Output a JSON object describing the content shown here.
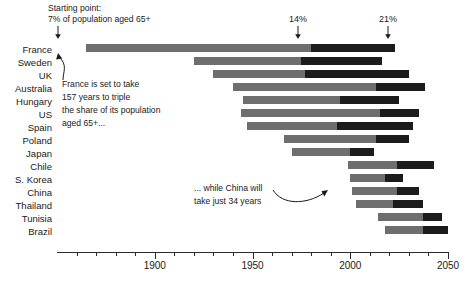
{
  "chart_data": {
    "type": "bar",
    "subtype": "horizontal-range-bar",
    "title": "",
    "xlabel": "",
    "ylabel": "",
    "xlim": [
      1850,
      2050
    ],
    "grid": false,
    "legend_position": "none",
    "x_ticks_major": [
      1900,
      1950,
      2000,
      2050
    ],
    "x_tick_labels": [
      "1900",
      "1950",
      "2000",
      "2050"
    ],
    "x_ticks_minor_step": 10,
    "x_tick_minor_start": 1860,
    "categories": [
      "France",
      "Sweden",
      "UK",
      "Australia",
      "Hungary",
      "US",
      "Spain",
      "Poland",
      "Japan",
      "Chile",
      "S. Korea",
      "China",
      "Thailand",
      "Tunisia",
      "Brazil"
    ],
    "series": [
      {
        "name": "7% to 14% of population aged 65+",
        "color": "#6e6e6e"
      },
      {
        "name": "14% to 21% of population aged 65+",
        "color": "#1c1c1c"
      }
    ],
    "bars": [
      {
        "country": "France",
        "start": 1865,
        "mid": 1980,
        "end": 2023
      },
      {
        "country": "Sweden",
        "start": 1920,
        "mid": 1975,
        "end": 2016
      },
      {
        "country": "UK",
        "start": 1930,
        "mid": 1977,
        "end": 2030
      },
      {
        "country": "Australia",
        "start": 1940,
        "mid": 2013,
        "end": 2038
      },
      {
        "country": "Hungary",
        "start": 1945,
        "mid": 1995,
        "end": 2025
      },
      {
        "country": "US",
        "start": 1944,
        "mid": 2015,
        "end": 2035
      },
      {
        "country": "Spain",
        "start": 1947,
        "mid": 1993,
        "end": 2032
      },
      {
        "country": "Poland",
        "start": 1966,
        "mid": 2013,
        "end": 2030
      },
      {
        "country": "Japan",
        "start": 1970,
        "mid": 2000,
        "end": 2012
      },
      {
        "country": "Chile",
        "start": 1999,
        "mid": 2024,
        "end": 2043
      },
      {
        "country": "S. Korea",
        "start": 2000,
        "mid": 2018,
        "end": 2027
      },
      {
        "country": "China",
        "start": 2001,
        "mid": 2024,
        "end": 2035
      },
      {
        "country": "Thailand",
        "start": 2003,
        "mid": 2022,
        "end": 2037
      },
      {
        "country": "Tunisia",
        "start": 2014,
        "mid": 2037,
        "end": 2047
      },
      {
        "country": "Brazil",
        "start": 2018,
        "mid": 2037,
        "end": 2050
      }
    ],
    "annotations": [
      {
        "id": "start-point",
        "text_line1": "Starting point:",
        "text_line2": "7% of population aged 65+",
        "points_to_year": 1865
      },
      {
        "id": "pct-14",
        "text": "14%",
        "points_to_year": 1980
      },
      {
        "id": "pct-21",
        "text": "21%",
        "points_to_year": 2023
      },
      {
        "id": "france-note",
        "line1": "France is set to take",
        "line2": "157 years to triple",
        "line3": "the share of its population",
        "line4": "aged 65+..."
      },
      {
        "id": "china-note",
        "line1": "... while China will",
        "line2": "take just 34 years"
      }
    ]
  },
  "axis": {
    "years": [
      "1900",
      "1950",
      "2000",
      "2050"
    ]
  },
  "categories": {
    "c0": "France",
    "c1": "Sweden",
    "c2": "UK",
    "c3": "Australia",
    "c4": "Hungary",
    "c5": "US",
    "c6": "Spain",
    "c7": "Poland",
    "c8": "Japan",
    "c9": "Chile",
    "c10": "S. Korea",
    "c11": "China",
    "c12": "Thailand",
    "c13": "Tunisia",
    "c14": "Brazil"
  },
  "annotations": {
    "start_line1": "Starting point:",
    "start_line2": "7% of population aged 65+",
    "pct14": "14%",
    "pct21": "21%",
    "france_l1": "France is set to take",
    "france_l2": "157 years to triple",
    "france_l3": "the share of its population",
    "france_l4": "aged 65+...",
    "china_l1": "... while China will",
    "china_l2": "take just 34 years"
  },
  "colors": {
    "segment_light": "#6e6e6e",
    "segment_dark": "#1c1c1c",
    "text": "#1a1a1a",
    "axis": "#2a2a2a",
    "background": "#ffffff"
  }
}
